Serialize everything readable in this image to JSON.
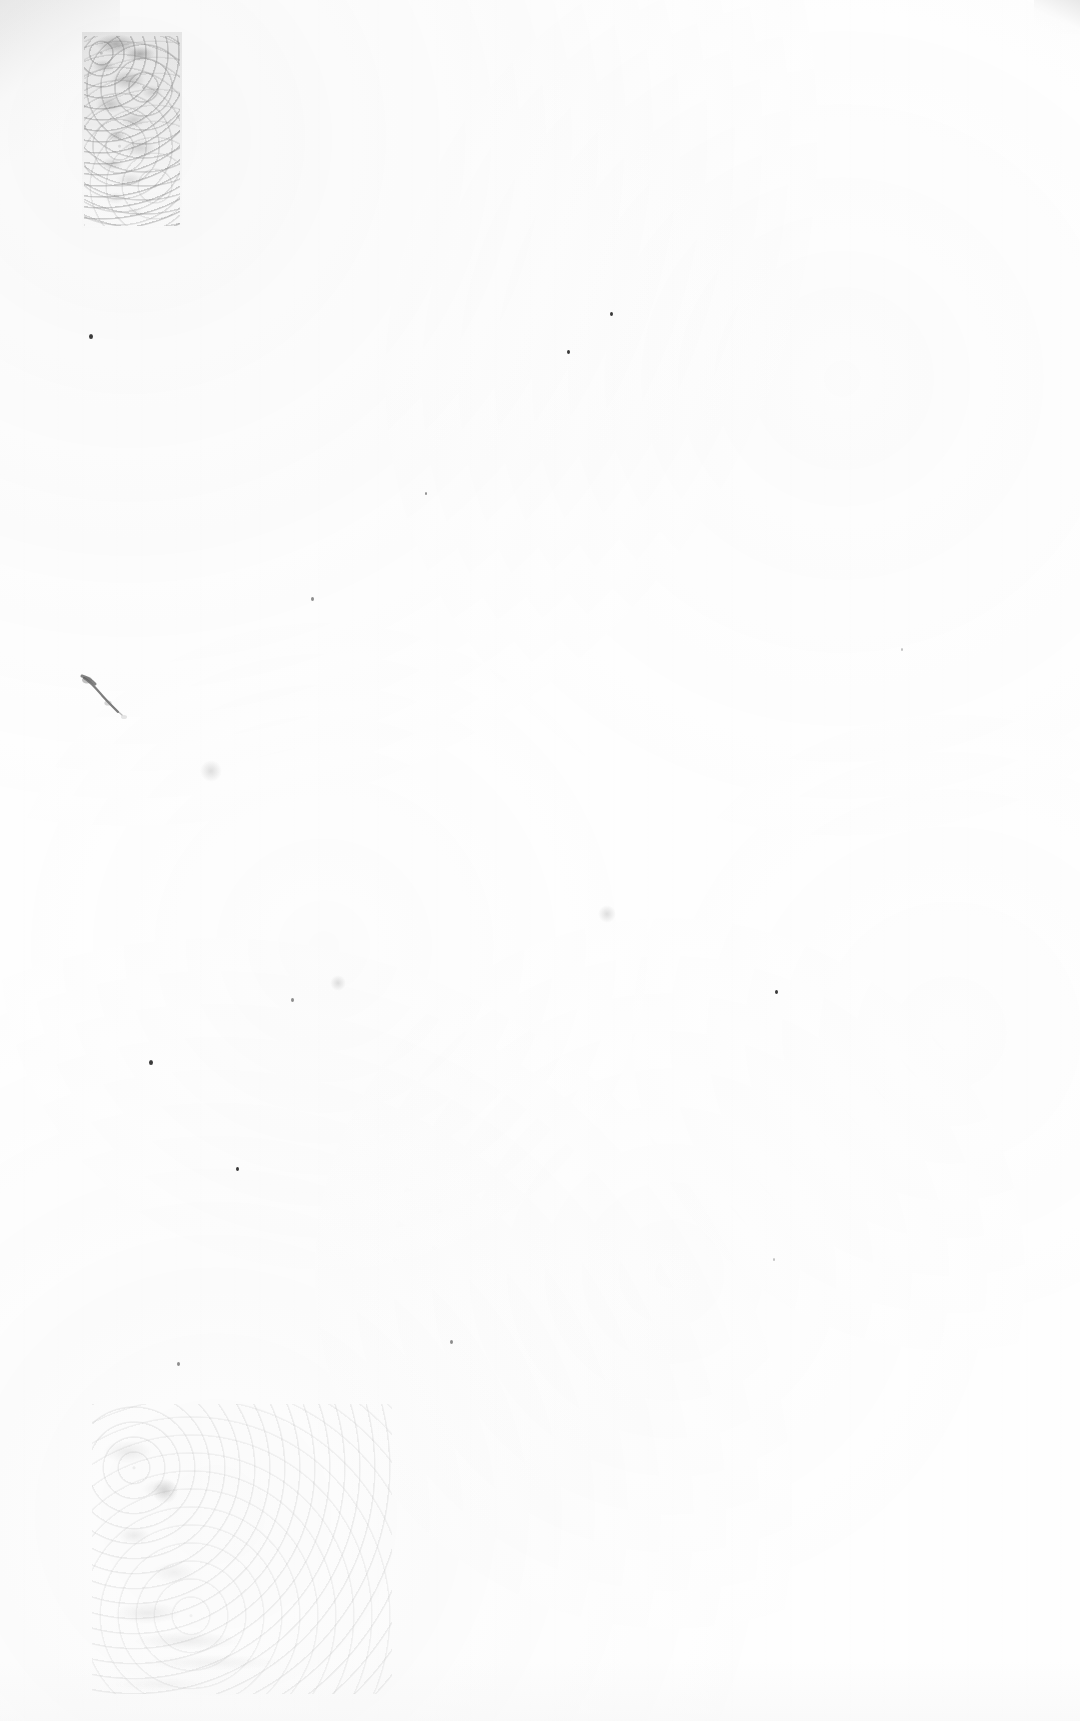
{
  "document": {
    "type": "scanned-page",
    "title": "Blank scanned page",
    "page_text": "",
    "has_visible_text": false,
    "orientation": "portrait",
    "width_px": 1080,
    "height_px": 1721,
    "background_color": "#fefefe",
    "paper_tone": "near-white",
    "ink_color": "#3a3a3a"
  },
  "artifacts": {
    "description": "Scanner and paper artifacts only; no legible text or graphics on the page.",
    "smudges": [
      {
        "name": "upper-left-mottled-smudge",
        "x": 82,
        "y": 32,
        "width": 100,
        "height": 200,
        "tone": "#787878",
        "note": "Dense mottled grey vertical patch fading downward"
      },
      {
        "name": "mid-left-diagonal-stroke",
        "x": 78,
        "y": 672,
        "width": 70,
        "height": 50,
        "tone": "#6f6f6f",
        "note": "Thin diagonal pen-like stroke with tail"
      },
      {
        "name": "lower-left-faint-band",
        "x": 88,
        "y": 1396,
        "width": 330,
        "height": 310,
        "tone": "#b4b4b4",
        "note": "Very faint mottled band near the bottom margin"
      }
    ],
    "specks": [
      {
        "x": 89,
        "y": 334,
        "size": 4,
        "tone": "dark"
      },
      {
        "x": 610,
        "y": 312,
        "size": 3,
        "tone": "dark"
      },
      {
        "x": 567,
        "y": 350,
        "size": 3,
        "tone": "dark"
      },
      {
        "x": 425,
        "y": 492,
        "size": 2,
        "tone": "soft"
      },
      {
        "x": 311,
        "y": 597,
        "size": 3,
        "tone": "soft"
      },
      {
        "x": 901,
        "y": 648,
        "size": 2,
        "tone": "faint"
      },
      {
        "x": 291,
        "y": 998,
        "size": 3,
        "tone": "soft"
      },
      {
        "x": 775,
        "y": 990,
        "size": 3,
        "tone": "dark"
      },
      {
        "x": 149,
        "y": 1060,
        "size": 4,
        "tone": "dark"
      },
      {
        "x": 450,
        "y": 1340,
        "size": 3,
        "tone": "soft"
      },
      {
        "x": 177,
        "y": 1362,
        "size": 3,
        "tone": "soft"
      },
      {
        "x": 236,
        "y": 1167,
        "size": 3,
        "tone": "dark"
      },
      {
        "x": 773,
        "y": 1258,
        "size": 2,
        "tone": "faint"
      }
    ],
    "blotches": [
      {
        "x": 330,
        "y": 975,
        "size": 16
      },
      {
        "x": 200,
        "y": 760,
        "size": 22
      },
      {
        "x": 598,
        "y": 905,
        "size": 18
      },
      {
        "x": 152,
        "y": 1478,
        "size": 26
      }
    ],
    "edge_shading": {
      "top_left_corner": "#cdcdcd",
      "top_right_corner": "#c6c6c6",
      "bottom_edge": "#f6f6f6"
    }
  }
}
